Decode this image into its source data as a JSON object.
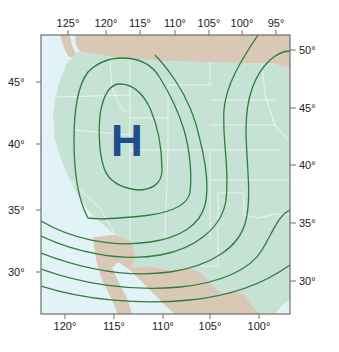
{
  "map": {
    "type": "weather-pressure-map",
    "region": "Western United States",
    "pressure_center": {
      "label": "H",
      "meaning": "high-pressure",
      "color": "#1f4e8c"
    },
    "colors": {
      "us_land": "#c5e2d5",
      "canada_mexico_land": "#d9c8b6",
      "ocean": "#e2f3f7",
      "contour": "#2f7d3c",
      "state_border": "#eef7f2",
      "frame": "#6e6e6e"
    },
    "top_axis": {
      "labels": [
        "125°",
        "120°",
        "115°",
        "110°",
        "105°",
        "100°",
        "95°"
      ],
      "x": [
        68,
        106,
        140,
        175,
        209,
        242,
        276
      ]
    },
    "bottom_axis": {
      "labels": [
        "120°",
        "115°",
        "110°",
        "105°",
        "100°"
      ],
      "x": [
        65,
        114,
        163,
        210,
        259
      ]
    },
    "left_axis": {
      "labels": [
        "45°",
        "40°",
        "35°",
        "30°"
      ],
      "y": [
        82,
        144,
        210,
        272
      ]
    },
    "right_axis": {
      "labels": [
        "50°",
        "45°",
        "40°",
        "35°",
        "30°"
      ],
      "y": [
        50,
        108,
        165,
        223,
        281
      ]
    },
    "contour_count": 7
  }
}
